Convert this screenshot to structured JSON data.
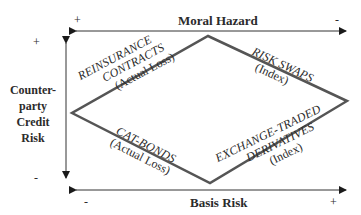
{
  "diagram": {
    "top_axis": {
      "label": "Moral Hazard",
      "left_sign": "+",
      "right_sign": "-"
    },
    "bottom_axis": {
      "label": "Basis Risk",
      "left_sign": "-",
      "right_sign": "+"
    },
    "vertical_axis": {
      "label_lines": [
        "Counter-",
        "party",
        "Credit",
        "Risk"
      ],
      "top_sign": "+",
      "bottom_sign": "-"
    },
    "quadrants": {
      "top_left": {
        "lines": [
          "REINSURANCE",
          "CONTRACTS"
        ],
        "sub": "(Actual Loss)"
      },
      "top_right": {
        "lines": [
          "RISK SWAPS"
        ],
        "sub": "(Index)"
      },
      "bottom_left": {
        "lines": [
          "CAT-BONDS"
        ],
        "sub": "(Actual Loss)"
      },
      "bottom_right": {
        "lines": [
          "EXCHANGE-TRADED",
          "DERIVATIVES"
        ],
        "sub": "(Index)"
      }
    },
    "colors": {
      "line": "#555555",
      "text": "#2b2b2b"
    }
  }
}
